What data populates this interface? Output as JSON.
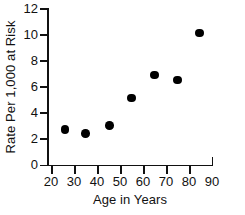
{
  "chart_data": {
    "type": "scatter",
    "title": "",
    "xlabel": "Age in Years",
    "ylabel": "Rate Per 1,000 at Risk",
    "xlim": [
      15,
      90
    ],
    "ylim": [
      0,
      12
    ],
    "xticks": [
      20,
      30,
      40,
      50,
      60,
      70,
      80,
      90
    ],
    "yticks": [
      0,
      2,
      4,
      6,
      8,
      10,
      12
    ],
    "xtick_labels": [
      "20",
      "30",
      "40",
      "50",
      "60",
      "70",
      "80",
      "90"
    ],
    "ytick_labels": [
      "0",
      "2",
      "4",
      "6",
      "8",
      "10",
      "12"
    ],
    "grid": false,
    "legend": null,
    "marker": "filled-circle",
    "marker_color": "#000000",
    "x": [
      26,
      35,
      45.5,
      55,
      65,
      75,
      84.5
    ],
    "y": [
      2.7,
      2.4,
      3.0,
      5.1,
      6.9,
      6.5,
      10.1
    ],
    "points": [
      {
        "x": 26,
        "y": 2.7
      },
      {
        "x": 35,
        "y": 2.4
      },
      {
        "x": 45.5,
        "y": 3.0
      },
      {
        "x": 55,
        "y": 5.1
      },
      {
        "x": 65,
        "y": 6.9
      },
      {
        "x": 75,
        "y": 6.5
      },
      {
        "x": 84.5,
        "y": 10.1
      }
    ]
  },
  "axes": {
    "x_title": "Age in Years",
    "y_title": "Rate Per 1,000 at Risk"
  }
}
